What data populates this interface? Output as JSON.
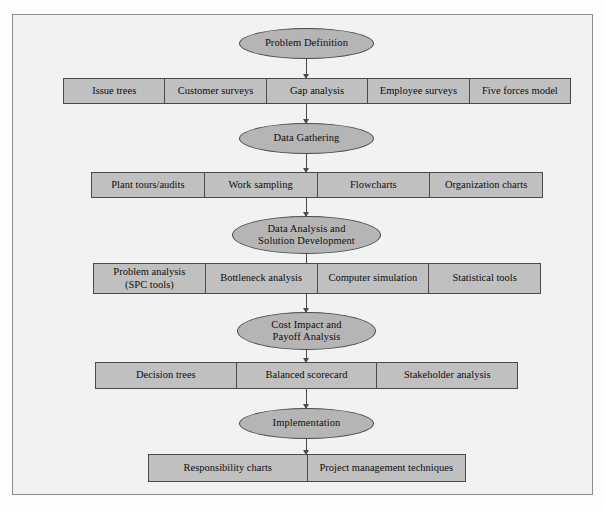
{
  "figure": {
    "type": "flowchart",
    "colors": {
      "page_background": "#fdfdfd",
      "frame_background": "#f2f2f2",
      "frame_border": "#8c8c8c",
      "ellipse_fill": "#b5b5b5",
      "box_fill": "#c0c0c0",
      "line_color": "#4a4a4a",
      "text_color": "#0d0d0d"
    },
    "top_artifact": "cut-off text above frame"
  },
  "stages": [
    {
      "id": "problem-definition",
      "label": "Problem Definition",
      "tools": [
        "Issue trees",
        "Customer surveys",
        "Gap analysis",
        "Employee surveys",
        "Five forces model"
      ]
    },
    {
      "id": "data-gathering",
      "label": "Data Gathering",
      "tools": [
        "Plant tours/audits",
        "Work sampling",
        "Flowcharts",
        "Organization charts"
      ]
    },
    {
      "id": "data-analysis",
      "label": "Data Analysis and\nSolution Development",
      "label_line1": "Data Analysis and",
      "label_line2": "Solution Development",
      "tools": [
        "Problem analysis\n(SPC tools)",
        "Bottleneck analysis",
        "Computer simulation",
        "Statistical tools"
      ],
      "tool_lines": [
        {
          "line1": "Problem analysis",
          "line2": "(SPC tools)"
        }
      ]
    },
    {
      "id": "cost-impact",
      "label": "Cost Impact and\nPayoff Analysis",
      "label_line1": "Cost Impact and",
      "label_line2": "Payoff Analysis",
      "tools": [
        "Decision trees",
        "Balanced scorecard",
        "Stakeholder analysis"
      ]
    },
    {
      "id": "implementation",
      "label": "Implementation",
      "tools": [
        "Responsibility charts",
        "Project management techniques"
      ]
    }
  ]
}
